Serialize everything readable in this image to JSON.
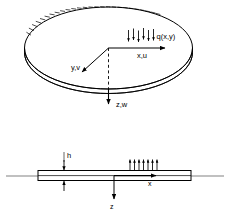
{
  "figure": {
    "background_color": "#ffffff",
    "line_color": "#000000",
    "width": 229,
    "height": 212
  },
  "top_view": {
    "name": "isometric-plate-view",
    "shape": "ellipse-disk",
    "edge_condition": "clamped-hatched-arc",
    "load_label": "q(x,y)",
    "load_arrow_count": 6,
    "load_direction": "downward",
    "axes": [
      {
        "id": "x",
        "label": "x,u",
        "direction": "right"
      },
      {
        "id": "y",
        "label": "y,v",
        "direction": "lower-left"
      },
      {
        "id": "z",
        "label": "z,w",
        "direction": "down"
      }
    ]
  },
  "section_view": {
    "name": "plate-cross-section",
    "thickness_label": "h",
    "load_arrow_count": 7,
    "load_direction": "upward",
    "axes": [
      {
        "id": "x",
        "label": "x",
        "direction": "right"
      },
      {
        "id": "z",
        "label": "z",
        "direction": "down"
      }
    ]
  }
}
